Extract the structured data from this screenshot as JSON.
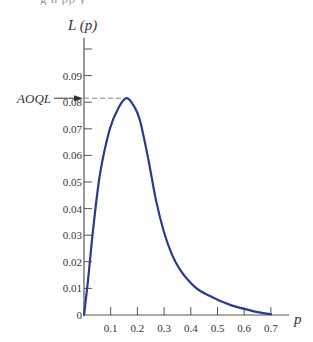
{
  "header": {
    "cropped_text": "g            h                 pp               y"
  },
  "chart_data": {
    "type": "line",
    "title": "",
    "xlabel": "p",
    "ylabel": "L (p)",
    "xlim": [
      0,
      0.75
    ],
    "ylim": [
      0,
      0.1
    ],
    "grid": false,
    "legend": null,
    "x_ticks": [
      0.1,
      0.2,
      0.3,
      0.4,
      0.5,
      0.6,
      0.7
    ],
    "x_tick_labels": [
      "0.1",
      "0.2",
      "0.3",
      "0.4",
      "0.5",
      "0.6",
      "0.7"
    ],
    "y_ticks": [
      0,
      0.01,
      0.02,
      0.03,
      0.04,
      0.05,
      0.06,
      0.07,
      0.08,
      0.09,
      0.1
    ],
    "y_tick_labels": [
      "0",
      "0.01",
      "0.02",
      "0.03",
      "0.04",
      "0.05",
      "0.06",
      "0.07",
      "0.08",
      "0.09",
      ""
    ],
    "series": [
      {
        "name": "L(p)",
        "color": "#2b3a8f",
        "x": [
          0,
          0.015,
          0.034,
          0.06,
          0.097,
          0.13,
          0.16,
          0.19,
          0.21,
          0.24,
          0.27,
          0.3,
          0.33,
          0.36,
          0.4,
          0.43,
          0.47,
          0.51,
          0.55,
          0.6,
          0.65,
          0.7
        ],
        "y": [
          0,
          0.013,
          0.032,
          0.053,
          0.07,
          0.078,
          0.0815,
          0.078,
          0.073,
          0.059,
          0.043,
          0.031,
          0.0226,
          0.017,
          0.012,
          0.0094,
          0.0072,
          0.0053,
          0.0037,
          0.0023,
          0.0011,
          0.0003
        ]
      }
    ],
    "annotations": [
      {
        "label": "AOQL",
        "type": "arrow-with-dashed-line",
        "value": 0.0815,
        "at_p": 0.16,
        "dashed_color": "#888888"
      }
    ],
    "axis_color": "#555555",
    "text_color": "#333333"
  }
}
